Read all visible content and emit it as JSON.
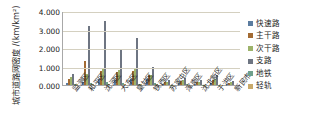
{
  "chart_data": {
    "type": "bar",
    "title": "",
    "subtitle": "",
    "ylabel": "城市道路网密度 /(km/km²)",
    "xlabel": "",
    "ylim": [
      0,
      4.0
    ],
    "ytick_values": [
      0.0,
      1.0,
      2.0,
      3.0,
      4.0
    ],
    "ytick_labels": [
      "0.000",
      "1.000",
      "2.000",
      "3.000",
      "4.000"
    ],
    "grid": true,
    "legend_position": "right",
    "categories": [
      "监测区",
      "和平区",
      "沈河区",
      "大东区",
      "皇姑区",
      "铁西区",
      "苏家屯区",
      "浑南区",
      "沈北新区",
      "于洪区",
      "新民市"
    ],
    "series": [
      {
        "name": "快速路",
        "color": "#5b7ca0",
        "values": [
          0.12,
          0.18,
          0.33,
          0.26,
          0.32,
          0.3,
          0.08,
          0.11,
          0.06,
          0.09,
          0.05
        ]
      },
      {
        "name": "主干路",
        "color": "#a36b33",
        "values": [
          0.3,
          1.32,
          0.76,
          0.7,
          0.76,
          0.52,
          0.17,
          0.23,
          0.17,
          0.26,
          0.12
        ]
      },
      {
        "name": "次干路",
        "color": "#9db36a",
        "values": [
          0.43,
          0.62,
          0.9,
          0.82,
          0.88,
          0.56,
          0.18,
          0.26,
          0.19,
          0.33,
          0.15
        ]
      },
      {
        "name": "支路",
        "color": "#6e7582",
        "values": [
          0.58,
          3.18,
          3.48,
          1.88,
          2.52,
          1.0,
          0.28,
          0.4,
          0.28,
          0.52,
          0.22
        ]
      },
      {
        "name": "地铁",
        "color": "#6fa08c",
        "values": [
          0.05,
          0.09,
          0.14,
          0.11,
          0.07,
          0.09,
          0.01,
          0.03,
          0.01,
          0.02,
          0.0
        ]
      },
      {
        "name": "轻轨",
        "color": "#c8a96a",
        "values": [
          0.04,
          0.03,
          0.04,
          0.04,
          0.03,
          0.03,
          0.01,
          0.02,
          0.01,
          0.01,
          0.0
        ]
      }
    ]
  }
}
